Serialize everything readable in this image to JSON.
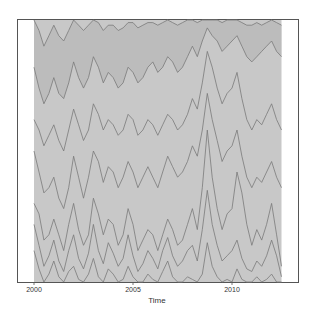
{
  "chart_data": {
    "type": "area",
    "stacked": true,
    "title": "",
    "xlabel": "Time",
    "ylabel": "",
    "xlim": [
      2000,
      2013.3
    ],
    "ylim": [
      0,
      100
    ],
    "x_ticks": [
      2000,
      2005,
      2010
    ],
    "x_tick_labels": [
      "2000",
      "2005",
      "2010"
    ],
    "y_ticks": [],
    "grid": false,
    "legend": "none",
    "fill_color": "#c8c8c8",
    "top_fill_color": "#b4b4b4",
    "line_color": "#7a7a7a",
    "frame_color": "#555555",
    "x": [
      2000.0,
      2000.25,
      2000.5,
      2000.75,
      2001.0,
      2001.25,
      2001.5,
      2001.75,
      2002.0,
      2002.25,
      2002.5,
      2002.75,
      2003.0,
      2003.25,
      2003.5,
      2003.75,
      2004.0,
      2004.25,
      2004.5,
      2004.75,
      2005.0,
      2005.25,
      2005.5,
      2005.75,
      2006.0,
      2006.25,
      2006.5,
      2006.75,
      2007.0,
      2007.25,
      2007.5,
      2007.75,
      2008.0,
      2008.25,
      2008.5,
      2008.75,
      2009.0,
      2009.25,
      2009.5,
      2009.75,
      2010.0,
      2010.25,
      2010.5,
      2010.75,
      2011.0,
      2011.25,
      2011.5,
      2011.75,
      2012.0,
      2012.25,
      2012.5
    ],
    "series": [
      {
        "name": "s1 (cumulative)",
        "values": [
          12,
          5,
          0,
          3,
          8,
          2,
          0,
          4,
          6,
          1,
          0,
          3,
          9,
          2,
          0,
          5,
          3,
          0,
          1,
          6,
          2,
          0,
          0,
          3,
          1,
          0,
          4,
          8,
          2,
          0,
          0,
          2,
          1,
          0,
          3,
          15,
          6,
          2,
          0,
          1,
          0,
          5,
          1,
          0,
          0,
          2,
          0,
          1,
          3,
          0,
          0
        ]
      },
      {
        "name": "s2 (cumulative)",
        "values": [
          22,
          14,
          6,
          10,
          16,
          8,
          4,
          12,
          18,
          9,
          5,
          11,
          22,
          12,
          7,
          15,
          11,
          6,
          9,
          18,
          10,
          4,
          7,
          12,
          9,
          5,
          12,
          17,
          10,
          6,
          8,
          12,
          14,
          8,
          20,
          35,
          22,
          14,
          8,
          10,
          12,
          16,
          9,
          5,
          4,
          8,
          6,
          10,
          16,
          10,
          2
        ]
      },
      {
        "name": "s3 (cumulative)",
        "values": [
          30,
          26,
          16,
          18,
          24,
          18,
          12,
          22,
          30,
          20,
          14,
          18,
          32,
          26,
          18,
          24,
          22,
          14,
          18,
          28,
          22,
          12,
          16,
          20,
          18,
          12,
          18,
          24,
          20,
          14,
          16,
          22,
          28,
          20,
          36,
          58,
          40,
          28,
          20,
          26,
          28,
          42,
          34,
          22,
          14,
          20,
          16,
          22,
          30,
          18,
          6
        ]
      },
      {
        "name": "s4 (cumulative)",
        "values": [
          50,
          42,
          34,
          36,
          40,
          32,
          28,
          36,
          48,
          40,
          32,
          40,
          50,
          46,
          38,
          44,
          42,
          36,
          40,
          46,
          42,
          36,
          40,
          44,
          40,
          36,
          42,
          48,
          44,
          40,
          42,
          46,
          52,
          48,
          58,
          72,
          62,
          54,
          46,
          50,
          52,
          58,
          48,
          40,
          36,
          40,
          38,
          42,
          46,
          40,
          36
        ]
      },
      {
        "name": "s5 (cumulative)",
        "values": [
          62,
          58,
          52,
          56,
          60,
          54,
          50,
          58,
          66,
          60,
          54,
          58,
          68,
          64,
          58,
          62,
          60,
          56,
          58,
          64,
          62,
          56,
          58,
          62,
          60,
          56,
          60,
          64,
          62,
          58,
          60,
          64,
          70,
          66,
          76,
          88,
          82,
          74,
          68,
          72,
          74,
          80,
          70,
          62,
          58,
          62,
          60,
          64,
          68,
          62,
          58
        ]
      },
      {
        "name": "s6 (cumulative)",
        "values": [
          82,
          74,
          68,
          72,
          78,
          72,
          70,
          76,
          84,
          78,
          74,
          78,
          86,
          82,
          76,
          80,
          78,
          74,
          76,
          82,
          80,
          76,
          78,
          82,
          84,
          80,
          82,
          86,
          84,
          80,
          82,
          86,
          90,
          86,
          92,
          97,
          94,
          92,
          88,
          90,
          92,
          94,
          90,
          86,
          84,
          86,
          88,
          90,
          92,
          88,
          86
        ]
      },
      {
        "name": "s7 (cumulative)",
        "values": [
          100,
          96,
          90,
          94,
          98,
          94,
          92,
          96,
          100,
          98,
          96,
          98,
          100,
          99,
          96,
          98,
          98,
          96,
          97,
          99,
          99,
          97,
          98,
          99,
          99,
          98,
          99,
          100,
          99,
          98,
          99,
          100,
          100,
          99,
          100,
          100,
          100,
          100,
          99,
          100,
          100,
          100,
          99,
          98,
          98,
          99,
          98,
          99,
          100,
          99,
          98
        ]
      }
    ]
  },
  "axes": {
    "xlabel": "Time",
    "x_tick_labels": [
      "2000",
      "2005",
      "2010"
    ]
  }
}
